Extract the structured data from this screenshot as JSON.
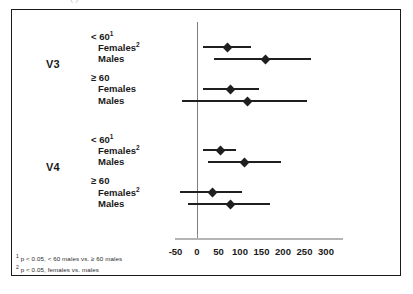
{
  "caption": {
    "clipped_top_text": "(                                                  )"
  },
  "chart_data": {
    "type": "scatter",
    "subtype": "forest-plot",
    "title": "",
    "xlabel": "",
    "ylabel": "",
    "xlim": [
      -60,
      330
    ],
    "xticks": [
      -50,
      0,
      50,
      100,
      150,
      200,
      250,
      300
    ],
    "xtick_labels": [
      "-50",
      "0",
      "50",
      "100",
      "150",
      "200",
      "250",
      "300"
    ],
    "grid": false,
    "legend": "none",
    "reference_line": 0,
    "groups": [
      {
        "name": "V3",
        "subgroups": [
          {
            "heading": "< 60",
            "heading_superscript": "1",
            "rows": [
              {
                "label": "Females",
                "superscript": "2",
                "estimate": 70,
                "ci_low": 15,
                "ci_high": 125
              },
              {
                "label": "Males",
                "superscript": "",
                "estimate": 160,
                "ci_low": 40,
                "ci_high": 265
              }
            ]
          },
          {
            "heading": "≥ 60",
            "heading_superscript": "",
            "rows": [
              {
                "label": "Females",
                "superscript": "",
                "estimate": 78,
                "ci_low": 15,
                "ci_high": 145
              },
              {
                "label": "Males",
                "superscript": "",
                "estimate": 118,
                "ci_low": -35,
                "ci_high": 255
              }
            ]
          }
        ]
      },
      {
        "name": "V4",
        "subgroups": [
          {
            "heading": "< 60",
            "heading_superscript": "1",
            "rows": [
              {
                "label": "Females",
                "superscript": "2",
                "estimate": 55,
                "ci_low": 15,
                "ci_high": 90
              },
              {
                "label": "Males",
                "superscript": "",
                "estimate": 110,
                "ci_low": 25,
                "ci_high": 195
              }
            ]
          },
          {
            "heading": "≥ 60",
            "heading_superscript": "",
            "rows": [
              {
                "label": "Females",
                "superscript": "2",
                "estimate": 35,
                "ci_low": -40,
                "ci_high": 105
              },
              {
                "label": "Males",
                "superscript": "",
                "estimate": 78,
                "ci_low": -20,
                "ci_high": 170
              }
            ]
          }
        ]
      }
    ],
    "footnotes": [
      {
        "marker": "1",
        "text": "p < 0.05, < 60 males vs. ≥ 60 males"
      },
      {
        "marker": "2",
        "text": "p < 0.05, females vs. males"
      }
    ]
  }
}
